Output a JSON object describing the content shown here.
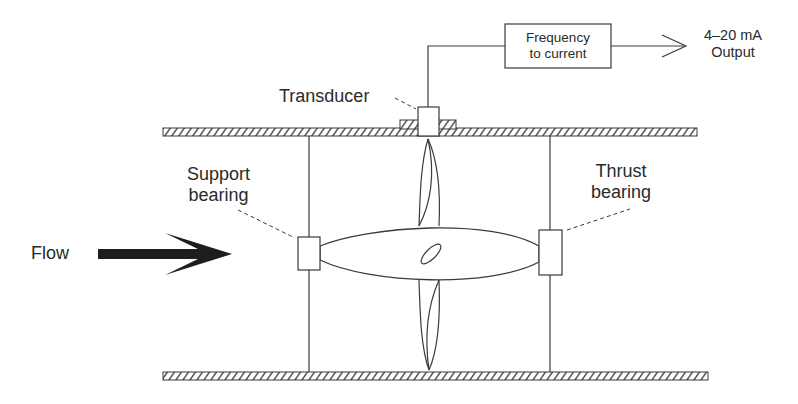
{
  "diagram": {
    "type": "turbine flowmeter schematic",
    "labels": {
      "flow": "Flow",
      "transducer": "Transducer",
      "support_bearing": [
        "Support",
        "bearing"
      ],
      "thrust_bearing": [
        "Thrust",
        "bearing"
      ],
      "converter_box": [
        "Frequency",
        "to current"
      ],
      "output": [
        "4–20 mA",
        "Output"
      ]
    },
    "components": [
      {
        "id": "pipe-wall-top",
        "kind": "hatched-wall"
      },
      {
        "id": "pipe-wall-bottom",
        "kind": "hatched-wall"
      },
      {
        "id": "transducer",
        "kind": "sensor"
      },
      {
        "id": "support-bearing",
        "kind": "bearing"
      },
      {
        "id": "thrust-bearing",
        "kind": "bearing"
      },
      {
        "id": "rotor-hub",
        "kind": "hub"
      },
      {
        "id": "rotor-blades",
        "kind": "blades"
      },
      {
        "id": "frequency-to-current-converter",
        "kind": "block"
      },
      {
        "id": "flow-arrow",
        "kind": "arrow"
      }
    ],
    "connections": [
      {
        "from": "transducer",
        "to": "frequency-to-current-converter"
      },
      {
        "from": "frequency-to-current-converter",
        "to": "output"
      }
    ],
    "colors": {
      "line": "#3a3a3a",
      "text": "#2a2a2a",
      "arrow_fill": "#1e1e1e",
      "background": "#ffffff"
    }
  }
}
